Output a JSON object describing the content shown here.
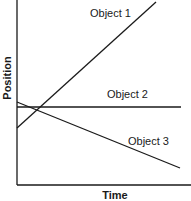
{
  "chart_data": {
    "type": "line",
    "title": "",
    "xlabel": "Time",
    "ylabel": "Position",
    "grid": false,
    "legend": "none (inline labels)",
    "axis": {
      "origin": [
        17,
        185
      ],
      "x_end": 191,
      "y_end": 0
    },
    "series": [
      {
        "name": "Object 1",
        "description": "increasing position over time",
        "start": [
          17,
          128
        ],
        "end": [
          156,
          2
        ],
        "label_pos": [
          90,
          17
        ]
      },
      {
        "name": "Object 2",
        "description": "constant position over time",
        "start": [
          17,
          107
        ],
        "end": [
          181,
          107
        ],
        "label_pos": [
          107,
          98
        ]
      },
      {
        "name": "Object 3",
        "description": "decreasing position over time",
        "start": [
          17,
          102
        ],
        "end": [
          180,
          168
        ],
        "label_pos": [
          128,
          145
        ]
      }
    ],
    "line_color": "#1a1a1a",
    "background": "#ffffff"
  }
}
